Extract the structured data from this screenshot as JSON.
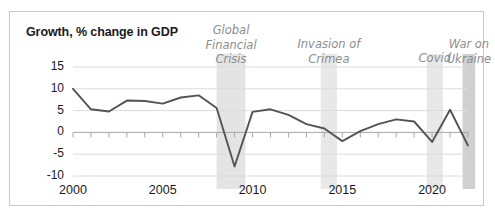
{
  "chart_data": {
    "type": "line",
    "title": "Growth, % change in GDP",
    "xlabel": "",
    "ylabel": "",
    "grid": true,
    "legend": "none",
    "xlim": [
      2000,
      2022
    ],
    "ylim": [
      -10,
      15
    ],
    "ytick_labels": [
      "15",
      "10",
      "5",
      "0",
      "-5",
      "-10"
    ],
    "ytick_values": [
      15,
      10,
      5,
      0,
      -5,
      -10
    ],
    "xtick_labels": [
      "2000",
      "2005",
      "2010",
      "2015",
      "2020"
    ],
    "xtick_values": [
      2000,
      2005,
      2010,
      2015,
      2020
    ],
    "x": [
      2000,
      2001,
      2002,
      2003,
      2004,
      2005,
      2006,
      2007,
      2008,
      2009,
      2010,
      2011,
      2012,
      2013,
      2014,
      2015,
      2016,
      2017,
      2018,
      2019,
      2020,
      2021,
      2022
    ],
    "values": [
      10.0,
      5.3,
      4.8,
      7.3,
      7.2,
      6.6,
      8.0,
      8.5,
      5.6,
      -7.8,
      4.7,
      5.3,
      4.0,
      1.9,
      0.9,
      -2.0,
      0.3,
      1.9,
      3.0,
      2.5,
      -2.2,
      5.2,
      -3.0
    ],
    "series_color": "#545454",
    "annotations": [
      {
        "id": "global-financial-crisis",
        "label": "Global\nFinancial\nCrisis",
        "band_start": 2008,
        "band_end": 2009.6,
        "band_color": "#e4e4e4"
      },
      {
        "id": "invasion-of-crimea",
        "label": "Invasion of\nCrimea",
        "band_start": 2013.8,
        "band_end": 2014.7,
        "band_color": "#e8e8e8"
      },
      {
        "id": "covid",
        "label": "Covid",
        "band_start": 2019.7,
        "band_end": 2020.6,
        "band_color": "#e8e8e8"
      },
      {
        "id": "war-on-ukraine",
        "label": "War on\nUkraine",
        "band_start": 2021.7,
        "band_end": 2022.4,
        "band_color": "#d0d0d0"
      }
    ]
  }
}
